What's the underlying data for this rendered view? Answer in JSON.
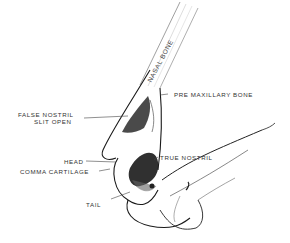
{
  "figure": {
    "labels": {
      "nasal_bone": "Nasal Bone",
      "pre_maxillary_bone": "Pre Maxillary Bone",
      "false_nostril_line1": "False Nostril",
      "false_nostril_line2": "Slit Open",
      "head": "Head",
      "comma_cartilage": "Comma Cartilage",
      "true_nostril": "True Nostril",
      "tail": "Tail"
    },
    "colors": {
      "background": "#ffffff",
      "ink": "#1a1a1a",
      "shade": "#555555",
      "label": "#333333"
    }
  }
}
